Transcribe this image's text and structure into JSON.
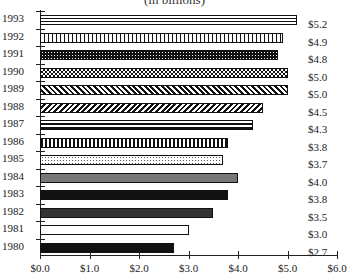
{
  "chart_data": {
    "type": "bar",
    "orientation": "horizontal",
    "title": "(in billions)",
    "xlabel": "",
    "ylabel": "",
    "xlim": [
      0,
      6
    ],
    "grid": false,
    "legend": null,
    "categories": [
      "1993",
      "1992",
      "1991",
      "1990",
      "1989",
      "1988",
      "1987",
      "1986",
      "1985",
      "1984",
      "1983",
      "1982",
      "1981",
      "1980"
    ],
    "values": [
      5.2,
      4.9,
      4.8,
      5.0,
      5.0,
      4.5,
      4.3,
      3.8,
      3.7,
      4.0,
      3.8,
      3.5,
      3.0,
      2.7
    ],
    "value_labels": [
      "$5.2",
      "$4.9",
      "$4.8",
      "$5.0",
      "$5.0",
      "$4.5",
      "$4.3",
      "$3.8",
      "$3.7",
      "$4.0",
      "$3.8",
      "$3.5",
      "$3.0",
      "$2.7"
    ],
    "patterns": [
      "horizontal-stripes",
      "vertical-stripes",
      "dense-dots-dark",
      "checker",
      "diagonal-forward",
      "diagonal-back",
      "horizontal-stripes-bold",
      "vertical-stripes-bold",
      "light-dots",
      "solid-gray",
      "solid-black",
      "solid-dark-gray",
      "solid-white",
      "solid-black"
    ],
    "x_ticks": [
      "$0.0",
      "$1.0",
      "$2.0",
      "$3.0",
      "$4.0",
      "$5.0",
      "$6.0"
    ]
  }
}
